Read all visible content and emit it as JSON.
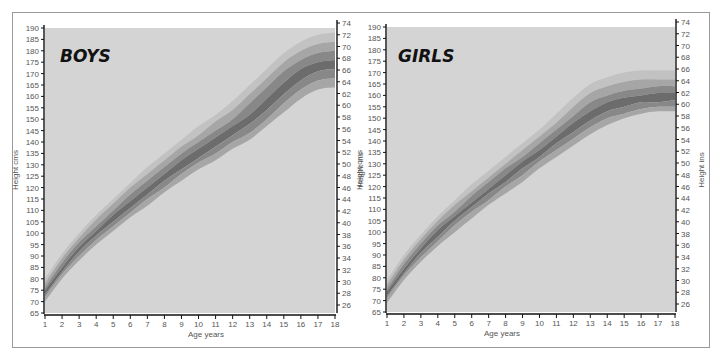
{
  "chart_data": [
    {
      "type": "area",
      "title": "BOYS",
      "xlabel": "Age years",
      "ylabel": "Height cms",
      "ylabel_right": "Height ins",
      "xlim": [
        1,
        18
      ],
      "ylim": [
        65,
        190
      ],
      "ylim_right": [
        26,
        74
      ],
      "x_ticks": [
        1,
        2,
        3,
        4,
        5,
        6,
        7,
        8,
        9,
        10,
        11,
        12,
        13,
        14,
        15,
        16,
        17,
        18
      ],
      "y_ticks": [
        65,
        70,
        75,
        80,
        85,
        90,
        95,
        100,
        105,
        110,
        115,
        120,
        125,
        130,
        135,
        140,
        145,
        150,
        155,
        160,
        165,
        170,
        175,
        180,
        185,
        190
      ],
      "y_ticks_right": [
        26,
        28,
        30,
        32,
        34,
        36,
        38,
        40,
        42,
        44,
        46,
        48,
        50,
        52,
        54,
        56,
        58,
        60,
        62,
        64,
        66,
        68,
        70,
        72,
        74
      ],
      "x": [
        1,
        2,
        3,
        4,
        5,
        6,
        7,
        8,
        9,
        10,
        11,
        12,
        13,
        14,
        15,
        16,
        17,
        18
      ],
      "series": [
        {
          "name": "97th centile",
          "values": [
            80,
            91,
            100,
            108,
            115,
            122,
            129,
            135,
            141,
            147,
            152,
            158,
            165,
            172,
            179,
            184,
            187,
            188
          ]
        },
        {
          "name": "90th centile",
          "values": [
            78,
            89,
            98,
            106,
            113,
            120,
            126,
            132,
            138,
            143,
            149,
            154,
            161,
            168,
            175,
            180,
            183,
            184
          ]
        },
        {
          "name": "75th centile",
          "values": [
            76,
            87,
            96,
            103,
            110,
            117,
            123,
            129,
            135,
            140,
            145,
            150,
            157,
            164,
            171,
            176,
            179,
            180
          ]
        },
        {
          "name": "50th centile",
          "values": [
            75,
            85,
            94,
            101,
            108,
            114,
            120,
            126,
            132,
            137,
            142,
            147,
            152,
            159,
            166,
            172,
            175,
            176
          ]
        },
        {
          "name": "25th centile",
          "values": [
            73,
            83,
            92,
            99,
            105,
            111,
            117,
            123,
            128,
            133,
            138,
            143,
            148,
            154,
            161,
            167,
            171,
            172
          ]
        },
        {
          "name": "10th centile",
          "values": [
            72,
            82,
            90,
            97,
            103,
            109,
            115,
            120,
            126,
            131,
            135,
            140,
            144,
            150,
            157,
            163,
            167,
            168
          ]
        },
        {
          "name": "3rd centile",
          "values": [
            70,
            80,
            88,
            95,
            101,
            107,
            112,
            118,
            123,
            128,
            132,
            137,
            141,
            147,
            153,
            159,
            163,
            164
          ]
        }
      ],
      "grid": false
    },
    {
      "type": "area",
      "title": "GIRLS",
      "xlabel": "Age years",
      "ylabel": "Height cms",
      "ylabel_right": "Height ins",
      "xlim": [
        1,
        18
      ],
      "ylim": [
        65,
        190
      ],
      "ylim_right": [
        26,
        74
      ],
      "x_ticks": [
        1,
        2,
        3,
        4,
        5,
        6,
        7,
        8,
        9,
        10,
        11,
        12,
        13,
        14,
        15,
        16,
        17,
        18
      ],
      "y_ticks": [
        65,
        70,
        75,
        80,
        85,
        90,
        95,
        100,
        105,
        110,
        115,
        120,
        125,
        130,
        135,
        140,
        145,
        150,
        155,
        160,
        165,
        170,
        175,
        180,
        185,
        190
      ],
      "y_ticks_right": [
        26,
        28,
        30,
        32,
        34,
        36,
        38,
        40,
        42,
        44,
        46,
        48,
        50,
        52,
        54,
        56,
        58,
        60,
        62,
        64,
        66,
        68,
        70,
        72,
        74
      ],
      "x": [
        1,
        2,
        3,
        4,
        5,
        6,
        7,
        8,
        9,
        10,
        11,
        12,
        13,
        14,
        15,
        16,
        17,
        18
      ],
      "series": [
        {
          "name": "97th centile",
          "values": [
            79,
            90,
            99,
            107,
            114,
            121,
            127,
            133,
            139,
            145,
            152,
            159,
            165,
            168,
            170,
            171,
            171,
            171
          ]
        },
        {
          "name": "90th centile",
          "values": [
            77,
            88,
            97,
            105,
            112,
            118,
            124,
            130,
            136,
            142,
            148,
            155,
            161,
            164,
            166,
            167,
            167,
            167
          ]
        },
        {
          "name": "75th centile",
          "values": [
            75,
            86,
            95,
            103,
            109,
            116,
            122,
            128,
            133,
            139,
            145,
            151,
            157,
            160,
            162,
            163,
            164,
            164
          ]
        },
        {
          "name": "50th centile",
          "values": [
            74,
            84,
            93,
            101,
            107,
            113,
            119,
            125,
            131,
            136,
            142,
            148,
            153,
            157,
            159,
            160,
            161,
            161
          ]
        },
        {
          "name": "25th centile",
          "values": [
            72,
            82,
            91,
            98,
            105,
            111,
            117,
            122,
            128,
            133,
            139,
            144,
            149,
            153,
            155,
            157,
            157,
            158
          ]
        },
        {
          "name": "10th centile",
          "values": [
            71,
            81,
            89,
            96,
            103,
            109,
            114,
            120,
            125,
            131,
            136,
            141,
            146,
            150,
            152,
            154,
            155,
            155
          ]
        },
        {
          "name": "3rd centile",
          "values": [
            69,
            79,
            87,
            94,
            100,
            106,
            112,
            117,
            122,
            128,
            133,
            138,
            143,
            147,
            150,
            152,
            153,
            153
          ]
        }
      ],
      "grid": false
    }
  ],
  "panels": {
    "boys": {
      "title": "BOYS",
      "xlabel": "Age years",
      "ylabel": "Height cms"
    },
    "girls": {
      "title": "GIRLS",
      "xlabel": "Age years",
      "ylabel": "Height cms",
      "ylabel_right": "Height ins"
    },
    "boys_right_label": "Height ins"
  },
  "colors": {
    "background": "#d4d4d4",
    "band_outer": "#c2c2c2",
    "band_mid": "#a6a6a6",
    "band_inner": "#888888",
    "band_core": "#6c6c6c",
    "axis": "#111111"
  }
}
